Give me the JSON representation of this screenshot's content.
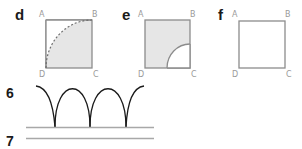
{
  "panels": [
    {
      "letter": "d",
      "vertices": {
        "A": "A",
        "B": "B",
        "C": "C",
        "D": "D"
      },
      "fill": "shaded quarter-circle region bounded by dashed arc from D to B"
    },
    {
      "letter": "e",
      "vertices": {
        "A": "A",
        "B": "B",
        "C": "C",
        "D": "D"
      },
      "fill": "shaded square with small quarter-circle cut out at corner C"
    },
    {
      "letter": "f",
      "vertices": {
        "A": "A",
        "B": "B",
        "C": "C",
        "D": "D"
      },
      "fill": "empty square"
    }
  ],
  "steps": [
    {
      "number": "6",
      "description": "row of arches standing on a baseline"
    },
    {
      "number": "7",
      "description": "single horizontal line"
    }
  ],
  "colors": {
    "square_stroke": "#8c8c8c",
    "shade": "#e6e6e6",
    "arc_stroke": "#1a1a1a",
    "line_stroke": "#a8a8a8",
    "vertex_label": "#9a9a9a"
  }
}
